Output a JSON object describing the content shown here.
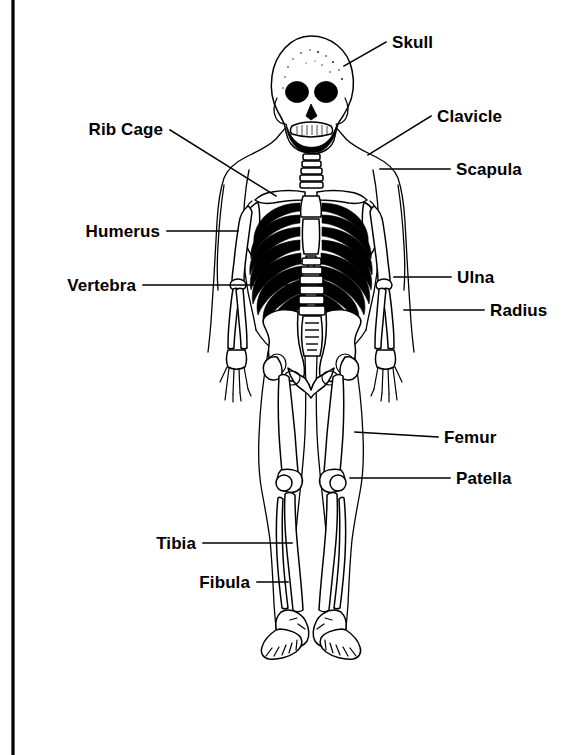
{
  "page": {
    "background_color": "#ffffff",
    "ink_color": "#000000",
    "width": 588,
    "height": 755
  },
  "frame": {
    "left_rule_label": "left-vertical-rule",
    "color": "#000000"
  },
  "figure": {
    "name": "human-skeleton-anterior-view"
  },
  "labels": [
    {
      "id": "skull",
      "text": "Skull",
      "side": "right",
      "text_x": 392,
      "text_y": 48,
      "leader": [
        [
          386,
          42
        ],
        [
          344,
          66
        ]
      ],
      "anchor": "start"
    },
    {
      "id": "clavicle",
      "text": "Clavicle",
      "side": "right",
      "text_x": 437,
      "text_y": 122,
      "leader": [
        [
          431,
          116
        ],
        [
          368,
          155
        ]
      ],
      "anchor": "start"
    },
    {
      "id": "scapula",
      "text": "Scapula",
      "side": "right",
      "text_x": 456,
      "text_y": 175,
      "leader": [
        [
          450,
          169
        ],
        [
          380,
          169
        ]
      ],
      "anchor": "start"
    },
    {
      "id": "rib-cage",
      "text": "Rib Cage",
      "side": "left",
      "text_x": 163,
      "text_y": 135,
      "leader": [
        [
          170,
          130
        ],
        [
          276,
          196
        ]
      ],
      "anchor": "end"
    },
    {
      "id": "humerus",
      "text": "Humerus",
      "side": "left",
      "text_x": 160,
      "text_y": 237,
      "leader": [
        [
          167,
          231
        ],
        [
          238,
          231
        ]
      ],
      "anchor": "end"
    },
    {
      "id": "vertebra",
      "text": "Vertebra",
      "side": "left",
      "text_x": 136,
      "text_y": 291,
      "leader": [
        [
          143,
          285
        ],
        [
          318,
          285
        ]
      ],
      "anchor": "end"
    },
    {
      "id": "ulna",
      "text": "Ulna",
      "side": "right",
      "text_x": 457,
      "text_y": 283,
      "leader": [
        [
          451,
          277
        ],
        [
          394,
          277
        ]
      ],
      "anchor": "start"
    },
    {
      "id": "radius",
      "text": "Radius",
      "side": "right",
      "text_x": 490,
      "text_y": 316,
      "leader": [
        [
          484,
          310
        ],
        [
          404,
          310
        ]
      ],
      "anchor": "start"
    },
    {
      "id": "femur",
      "text": "Femur",
      "side": "right",
      "text_x": 444,
      "text_y": 443,
      "leader": [
        [
          438,
          437
        ],
        [
          355,
          432
        ]
      ],
      "anchor": "start"
    },
    {
      "id": "patella",
      "text": "Patella",
      "side": "right",
      "text_x": 456,
      "text_y": 484,
      "leader": [
        [
          450,
          478
        ],
        [
          350,
          478
        ]
      ],
      "anchor": "start"
    },
    {
      "id": "tibia",
      "text": "Tibia",
      "side": "left",
      "text_x": 196,
      "text_y": 549,
      "leader": [
        [
          203,
          543
        ],
        [
          292,
          543
        ]
      ],
      "anchor": "end"
    },
    {
      "id": "fibula",
      "text": "Fibula",
      "side": "left",
      "text_x": 250,
      "text_y": 588,
      "leader": [
        [
          257,
          582
        ],
        [
          288,
          582
        ]
      ],
      "anchor": "end"
    }
  ]
}
